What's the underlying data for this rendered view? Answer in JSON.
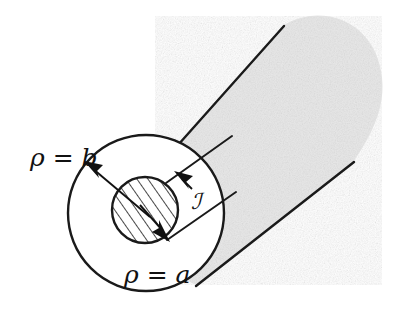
{
  "figure": {
    "type": "technical-diagram",
    "background_color": "#ffffff",
    "stroke_color": "#1a1a1a",
    "shade_color": "#e6e6e6",
    "labels": {
      "outer_radius": "ρ = b",
      "inner_radius": "ρ = a",
      "current": "ℐ"
    },
    "label_positions": {
      "outer_radius": {
        "x": 30,
        "y": 158
      },
      "inner_radius": {
        "x": 124,
        "y": 278
      },
      "current": {
        "x": 192,
        "y": 207
      }
    },
    "geometry": {
      "outer_circle": {
        "cx": 146,
        "cy": 213,
        "r": 78
      },
      "inner_circle": {
        "cx": 145,
        "cy": 210,
        "r": 33
      },
      "cylinder_top_edge": {
        "x1": 181,
        "y1": 141,
        "x2": 281,
        "y2": 28
      },
      "cylinder_bottom_edge": {
        "x1": 197,
        "y1": 285,
        "x2": 352,
        "y2": 163
      },
      "inner_tube_top_edge": {
        "x1": 168,
        "y1": 182,
        "x2": 226,
        "y2": 141
      },
      "inner_tube_bottom_edge": {
        "x1": 168,
        "y1": 238,
        "x2": 229,
        "y2": 196
      },
      "hatch_angle_degrees": -35,
      "hatch_line_count": 7
    },
    "arrows": [
      {
        "name": "outer-radius-arrow",
        "from": {
          "x": 146,
          "y": 213
        },
        "to": {
          "x": 87,
          "y": 163
        },
        "label": "ρ = b"
      },
      {
        "name": "inner-radius-arrow",
        "from": {
          "x": 146,
          "y": 213
        },
        "to": {
          "x": 167,
          "y": 238
        },
        "label": "ρ = a"
      },
      {
        "name": "current-direction-arrow",
        "from": {
          "x": 199,
          "y": 193
        },
        "to": {
          "x": 176,
          "y": 172
        },
        "label": "ℐ"
      }
    ]
  }
}
